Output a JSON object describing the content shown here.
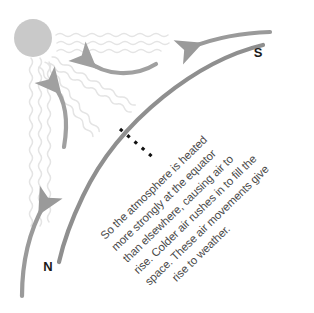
{
  "diagram": {
    "background_color": "#ffffff",
    "sun": {
      "name": "sun",
      "fill_color": "#c9c9c9",
      "center_x": 33,
      "center_y": 38,
      "radius": 19
    },
    "colors": {
      "sun_fill": "#c9c9c9",
      "sun_rays": "#e6e6e6",
      "earth_arc": "#8f8f8f",
      "wind_arrow": "#9a9a9a",
      "convection_arrow": "#a0a0a0",
      "dashed_line": "#111111",
      "label_text": "#1a1a1a",
      "caption_text": "#4a4a4a"
    },
    "labels": {
      "north": "N",
      "south": "S"
    },
    "caption": {
      "rotation_degrees": -44,
      "full_text": "So the atmosphere is heated more strongly at the equator than elsewhere, causing air to rise. Colder air rushes in to fill the space. These air movements give rise to weather.",
      "lines": [
        "So the atmosphere is heated",
        "more strongly at the equator",
        "than elsewhere, causing air to",
        "rise. Colder air rushes in to fill the",
        "space. These air movements give",
        "rise to weather."
      ]
    },
    "elements": {
      "equator_marker": "dashed-equator-line",
      "earth_surface": "earth-curvature-arc",
      "sun_ray_count": 11,
      "wind_arrow_label": "cold-air-inflow-arrow",
      "rising_air_label": "warm-air-rising-arrow"
    }
  }
}
